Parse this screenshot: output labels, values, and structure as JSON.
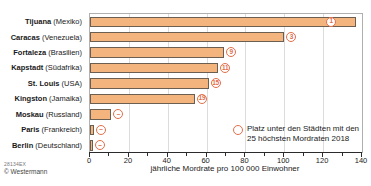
{
  "footer": {
    "code": "28134EX",
    "copyright": "© Westermann"
  },
  "chart_data": {
    "type": "bar",
    "orientation": "horizontal",
    "title": "",
    "xlabel": "jährliche Mordrate pro 100 000 Einwohner",
    "ylabel": "",
    "xlim": [
      0,
      140
    ],
    "xticks": [
      0,
      20,
      40,
      60,
      80,
      100,
      120,
      140
    ],
    "minor_tick_step": 10,
    "grid": "vertical-major",
    "legend_line1": "Platz unter den Städten mit den",
    "legend_line2": "25 höchsten Mordraten 2018",
    "legend_position": "inside-bottom-right",
    "rows": [
      {
        "city": "Tijuana",
        "country": "Mexiko",
        "value": 137,
        "rank": "1",
        "rank_inside": true
      },
      {
        "city": "Caracas",
        "country": "Venezuela",
        "value": 100,
        "rank": "3",
        "rank_inside": false
      },
      {
        "city": "Fortaleza",
        "country": "Brasilien",
        "value": 69,
        "rank": "9",
        "rank_inside": false
      },
      {
        "city": "Kapstadt",
        "country": "Südafrika",
        "value": 66,
        "rank": "11",
        "rank_inside": false
      },
      {
        "city": "St. Louis",
        "country": "USA",
        "value": 61,
        "rank": "15",
        "rank_inside": false
      },
      {
        "city": "Kingston",
        "country": "Jamaika",
        "value": 54,
        "rank": "19",
        "rank_inside": false
      },
      {
        "city": "Moskau",
        "country": "Russland",
        "value": 11,
        "rank": "–",
        "rank_inside": false
      },
      {
        "city": "Paris",
        "country": "Frankreich",
        "value": 2,
        "rank": "–",
        "rank_inside": false
      },
      {
        "city": "Berlin",
        "country": "Deutschland",
        "value": 1.5,
        "rank": "–",
        "rank_inside": false
      }
    ],
    "colors": {
      "bar_fill": "#f4b47e",
      "bar_border": "#6b5f52",
      "badge": "#e26e49",
      "grid": "#dcdcdc",
      "frame": "#b0b0b0",
      "axis": "#2b2b2b"
    }
  }
}
